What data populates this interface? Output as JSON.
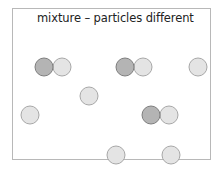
{
  "diagram": {
    "title": "mixture – particles different",
    "colors": {
      "dark_fill": "#b4b4b4",
      "dark_stroke": "#7e7e7e",
      "light_fill": "#e4e4e4",
      "light_stroke": "#a8a8a8",
      "border": "#b8b8b8"
    },
    "particle_radius": 9,
    "particles": [
      {
        "type": "compound",
        "atoms": [
          {
            "shade": "dark",
            "cx": 44,
            "cy": 67
          },
          {
            "shade": "light",
            "cx": 62,
            "cy": 67
          }
        ]
      },
      {
        "type": "compound",
        "atoms": [
          {
            "shade": "dark",
            "cx": 125,
            "cy": 67
          },
          {
            "shade": "light",
            "cx": 143,
            "cy": 67
          }
        ]
      },
      {
        "type": "element",
        "atoms": [
          {
            "shade": "light",
            "cx": 198,
            "cy": 67
          }
        ]
      },
      {
        "type": "element",
        "atoms": [
          {
            "shade": "light",
            "cx": 89,
            "cy": 96
          }
        ]
      },
      {
        "type": "element",
        "atoms": [
          {
            "shade": "light",
            "cx": 30,
            "cy": 115
          }
        ]
      },
      {
        "type": "compound",
        "atoms": [
          {
            "shade": "dark",
            "cx": 151,
            "cy": 115
          },
          {
            "shade": "light",
            "cx": 169,
            "cy": 115
          }
        ]
      },
      {
        "type": "element",
        "atoms": [
          {
            "shade": "light",
            "cx": 116,
            "cy": 155
          }
        ]
      },
      {
        "type": "element",
        "atoms": [
          {
            "shade": "light",
            "cx": 171,
            "cy": 155
          }
        ]
      }
    ]
  }
}
